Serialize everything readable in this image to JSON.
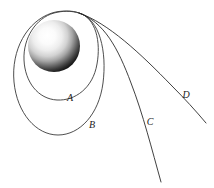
{
  "figure": {
    "background_color": "#ffffff",
    "width": 214,
    "height": 188
  },
  "body": {
    "name": "central-sphere",
    "description": "shaded sphere",
    "center": {
      "x": 54,
      "y": 46
    },
    "radius": 26,
    "highlight": {
      "x": 44,
      "y": 38
    },
    "highlight_color": "#ffffff",
    "shadow_color": "#101010",
    "rim_color": "#2a2a2a"
  },
  "launch_point": {
    "x": 79,
    "y": 13
  },
  "stroke_color": "#2b2b2b",
  "label_color": "#1a1a1a",
  "trajectories": [
    {
      "id": "A",
      "label": "A",
      "kind": "closed-ellipse",
      "label_pos": {
        "x": 70,
        "y": 101
      },
      "path": "M 79 13 C 96 18 101 42 97 64 C 93 88 75 101 57 100 C 38 99 25 82 24 60 C 23 38 36 18 54 13 C 62 11 72 10 79 13 Z"
    },
    {
      "id": "B",
      "label": "B",
      "kind": "closed-ellipse",
      "label_pos": {
        "x": 92,
        "y": 128
      },
      "path": "M 79 13 C 100 19 107 52 103 83 C 99 114 80 135 58 135 C 36 135 17 113 14 82 C 11 50 27 21 52 13 C 61 10 72 11 79 13 Z"
    },
    {
      "id": "C",
      "label": "C",
      "kind": "open-parabola",
      "label_pos": {
        "x": 150,
        "y": 125
      },
      "path": "M 79 13 C 104 22 118 48 131 83 C 143 114 152 150 161 182"
    },
    {
      "id": "D",
      "label": "D",
      "kind": "open-hyperbola",
      "label_pos": {
        "x": 186,
        "y": 98
      },
      "path": "M 79 13 C 108 23 140 53 172 86 C 184 98 196 111 206 123"
    }
  ]
}
